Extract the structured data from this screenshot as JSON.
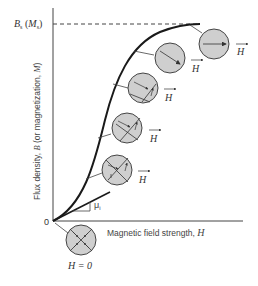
{
  "figure": {
    "y_axis_label": "Flux density, B (or magnetization, M)",
    "y_axis_label_parts": {
      "prefix": "Flux density, ",
      "var1": "B",
      "middle": " (or magnetization, ",
      "var2": "M",
      "suffix": ")"
    },
    "x_axis_label_parts": {
      "prefix": "Magnetic field strength, ",
      "var": "H"
    },
    "origin_label": "0",
    "saturation_label": {
      "B": "B",
      "B_sub": "s",
      "M_open": " (",
      "M": "M",
      "M_sub": "s",
      "M_close": ")"
    },
    "initial_permeability_label": {
      "mu": "μ",
      "sub": "i"
    },
    "zero_field_label": "H = 0",
    "field_label": "H",
    "domains": [
      {
        "name": "H=0",
        "state": "random domains"
      },
      {
        "name": "stage-1",
        "state": "domain growth begins"
      },
      {
        "name": "stage-2",
        "state": "favored domains grow"
      },
      {
        "name": "stage-3",
        "state": "more alignment"
      },
      {
        "name": "stage-4",
        "state": "single domain"
      },
      {
        "name": "stage-5",
        "state": "saturated, aligned with H"
      }
    ],
    "colors": {
      "curve": "#1a1a1a",
      "domain_fill": "#cfcfcf",
      "axis": "#333333",
      "text": "#333333"
    }
  }
}
